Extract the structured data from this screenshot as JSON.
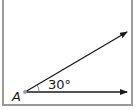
{
  "diagram": {
    "type": "angle",
    "vertex_label": "A",
    "angle_label": "30°",
    "angle_degrees": 30,
    "rays": [
      {
        "name": "upper-ray",
        "from": [
          25,
          92
        ],
        "to": [
          127,
          32
        ]
      },
      {
        "name": "lower-ray",
        "from": [
          25,
          92
        ],
        "to": [
          127,
          92
        ]
      }
    ],
    "colors": {
      "line": "#1a1a1a",
      "vertex_point": "#9a9a9a",
      "frame": "#9a9a9a"
    }
  }
}
